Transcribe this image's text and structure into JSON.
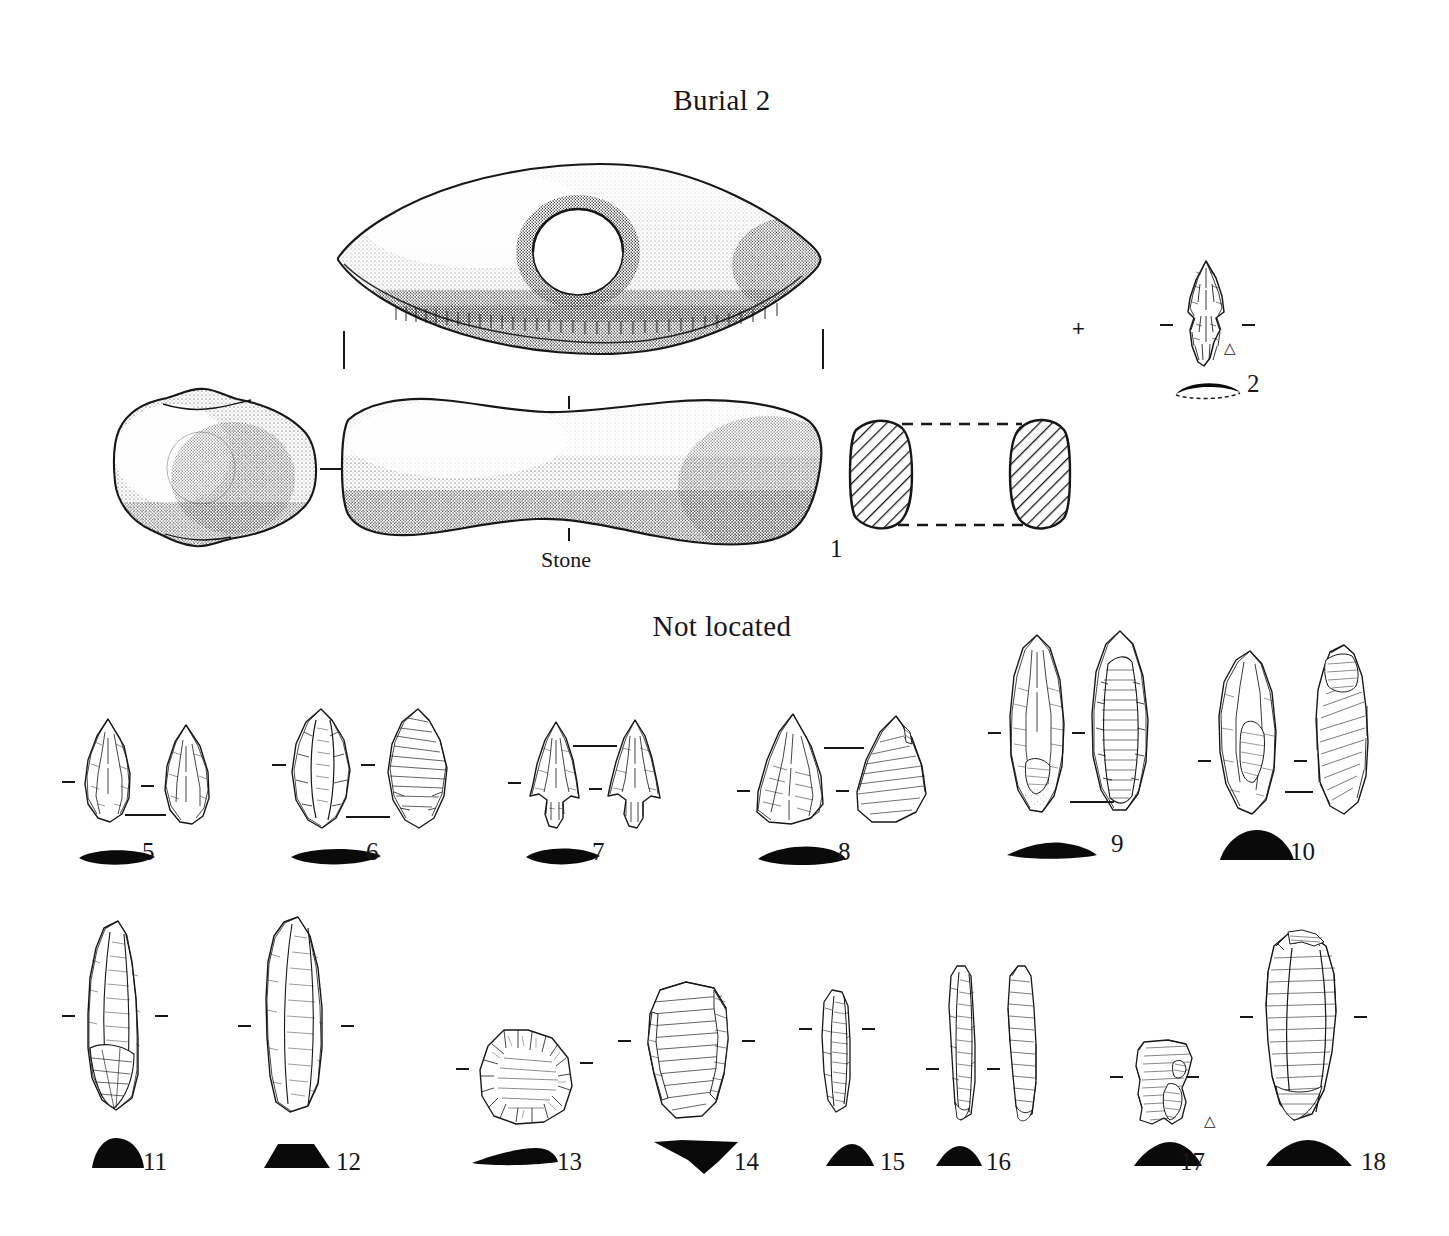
{
  "plate": {
    "headings": [
      {
        "id": "burial-2",
        "text": "Burial 2",
        "x": 592,
        "y": 84,
        "w": 260
      },
      {
        "id": "not-located",
        "text": "Not located",
        "x": 592,
        "y": 610,
        "w": 260
      }
    ],
    "labels": [
      {
        "id": "stone-material",
        "text": "Stone",
        "x": 541,
        "y": 547
      },
      {
        "id": "artifact-1",
        "text": "1",
        "x": 830,
        "y": 535
      },
      {
        "id": "artifact-2",
        "text": "2",
        "x": 1247,
        "y": 370
      },
      {
        "id": "artifact-5",
        "text": "5",
        "x": 142,
        "y": 838
      },
      {
        "id": "artifact-6",
        "text": "6",
        "x": 366,
        "y": 838
      },
      {
        "id": "artifact-7",
        "text": "7",
        "x": 592,
        "y": 838
      },
      {
        "id": "artifact-8",
        "text": "8",
        "x": 838,
        "y": 838
      },
      {
        "id": "artifact-9",
        "text": "9",
        "x": 1111,
        "y": 830
      },
      {
        "id": "artifact-10",
        "text": "10",
        "x": 1290,
        "y": 838
      },
      {
        "id": "artifact-11",
        "text": "11",
        "x": 143,
        "y": 1148
      },
      {
        "id": "artifact-12",
        "text": "12",
        "x": 336,
        "y": 1148
      },
      {
        "id": "artifact-13",
        "text": "13",
        "x": 557,
        "y": 1148
      },
      {
        "id": "artifact-14",
        "text": "14",
        "x": 734,
        "y": 1148
      },
      {
        "id": "artifact-15",
        "text": "15",
        "x": 880,
        "y": 1148
      },
      {
        "id": "artifact-16",
        "text": "16",
        "x": 986,
        "y": 1148
      },
      {
        "id": "artifact-17",
        "text": "17",
        "x": 1180,
        "y": 1148
      },
      {
        "id": "artifact-18",
        "text": "18",
        "x": 1361,
        "y": 1148
      }
    ],
    "marks": [
      {
        "id": "registration-cross",
        "type": "plus",
        "text": "+",
        "x": 1072,
        "y": 322
      },
      {
        "id": "material-triangle-2",
        "type": "triangle",
        "text": "△",
        "x": 1224,
        "y": 345
      },
      {
        "id": "material-triangle-17",
        "type": "triangle",
        "text": "△",
        "x": 1204,
        "y": 1118
      }
    ],
    "artifacts": [
      {
        "id": 1,
        "name": "grooved-stone-axe",
        "material": "Stone",
        "views": [
          "top",
          "butt-end",
          "side",
          "section"
        ],
        "section_shape": "hatched-oval-pair"
      },
      {
        "id": 2,
        "name": "corner-notched-projectile-point",
        "views": [
          "face"
        ],
        "section_shape": "thin-arc",
        "material_mark": "triangle"
      },
      {
        "id": 5,
        "name": "biface-ovate-point",
        "views": [
          "obverse",
          "reverse"
        ],
        "section_shape": "lenticular"
      },
      {
        "id": 6,
        "name": "biface-leaf-shaped",
        "views": [
          "obverse",
          "reverse"
        ],
        "section_shape": "lenticular"
      },
      {
        "id": 7,
        "name": "side-notched-projectile-point",
        "views": [
          "obverse",
          "reverse"
        ],
        "section_shape": "lenticular"
      },
      {
        "id": 8,
        "name": "triangular-projectile-point",
        "views": [
          "obverse",
          "reverse"
        ],
        "section_shape": "lenticular"
      },
      {
        "id": 9,
        "name": "ovate-biface-knife",
        "views": [
          "obverse",
          "reverse"
        ],
        "section_shape": "flat-lenticular"
      },
      {
        "id": 10,
        "name": "thick-biface-core",
        "views": [
          "obverse",
          "reverse"
        ],
        "section_shape": "plano-convex"
      },
      {
        "id": 11,
        "name": "elongate-endscraper",
        "views": [
          "obverse"
        ],
        "section_shape": "rounded-triangle"
      },
      {
        "id": 12,
        "name": "elongate-endscraper",
        "views": [
          "obverse"
        ],
        "section_shape": "trapezoid"
      },
      {
        "id": 13,
        "name": "ovate-scraper",
        "views": [
          "obverse"
        ],
        "section_shape": "thin-lens"
      },
      {
        "id": 14,
        "name": "retouched-flake",
        "views": [
          "obverse"
        ],
        "section_shape": "kite"
      },
      {
        "id": 15,
        "name": "narrow-blade",
        "views": [
          "obverse"
        ],
        "section_shape": "triangular"
      },
      {
        "id": 16,
        "name": "blade-pair",
        "views": [
          "obverse",
          "reverse"
        ],
        "section_shape": "low-triangle"
      },
      {
        "id": 17,
        "name": "retouched-flake-fragment",
        "views": [
          "obverse"
        ],
        "section_shape": "low-dome",
        "material_mark": "triangle"
      },
      {
        "id": 18,
        "name": "large-blade-flake",
        "views": [
          "obverse"
        ],
        "section_shape": "low-triangle"
      }
    ]
  }
}
